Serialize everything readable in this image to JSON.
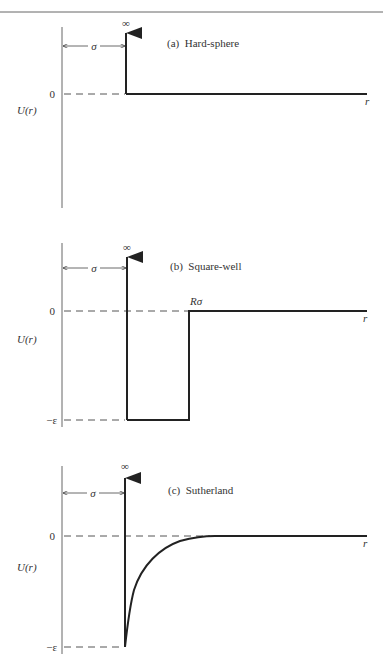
{
  "figure": {
    "colors": {
      "line": "#222222",
      "axis": "#555555",
      "text": "#333333",
      "dash": "#555555"
    }
  },
  "panels": [
    {
      "id": "a",
      "title": "(a)  Hard-sphere",
      "ylabel": "U(r)",
      "xlabel": "r",
      "zero_label": "0",
      "infinity_label": "∞",
      "sigma_label": "σ"
    },
    {
      "id": "b",
      "title": "(b)  Square-well",
      "ylabel": "U(r)",
      "xlabel": "r",
      "zero_label": "0",
      "epsilon_label": "−ε",
      "infinity_label": "∞",
      "sigma_label": "σ",
      "well_edge_label": "Rσ"
    },
    {
      "id": "c",
      "title": "(c)  Sutherland",
      "ylabel": "U(r)",
      "xlabel": "r",
      "zero_label": "0",
      "epsilon_label": "−ε",
      "infinity_label": "∞",
      "sigma_label": "σ"
    }
  ]
}
